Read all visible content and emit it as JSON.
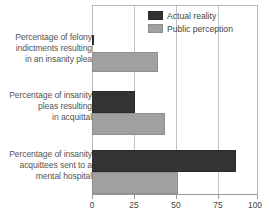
{
  "chart_data": {
    "type": "bar",
    "orientation": "horizontal",
    "title": "",
    "subtitle": "",
    "xlabel": "",
    "ylabel": "",
    "xlim": [
      0,
      100
    ],
    "xticks": [
      0,
      25,
      50,
      75,
      100
    ],
    "xtick_labels": [
      "0",
      "25",
      "50",
      "75",
      "100"
    ],
    "grid": true,
    "legend_position": "top-right",
    "categories": [
      "Percentage of felony indictments resulting in an insanity plea",
      "Percentage of insanity pleas resulting in acquittal",
      "Percentage of insanity acquittees sent to a mental hospital"
    ],
    "series": [
      {
        "name": "Actual reality",
        "color": "#333333",
        "values": [
          1,
          26,
          87
        ]
      },
      {
        "name": "Public perception",
        "color": "#a0a0a0",
        "values": [
          40,
          44,
          52
        ]
      }
    ]
  },
  "legend": {
    "entries": [
      {
        "label": "Actual reality",
        "swatch": "dark-swatch"
      },
      {
        "label": "Public perception",
        "swatch": "gray-swatch"
      }
    ]
  },
  "axis": {
    "tick_labels": [
      "0",
      "25",
      "50",
      "75",
      "100"
    ]
  },
  "categories": {
    "line_groups": [
      [
        "Percentage of felony",
        "indictments resulting",
        "in an insanity plea"
      ],
      [
        "Percentage of insanity",
        "pleas resulting",
        "in acquittal"
      ],
      [
        "Percentage of insanity",
        "acquittees sent to a",
        "mental hospital"
      ]
    ]
  },
  "colors": {
    "series_dark": "#333333",
    "series_gray": "#a0a0a0",
    "gridline": "#c4c4c4",
    "axis": "#9a9a9a",
    "label_text": "#555555"
  }
}
